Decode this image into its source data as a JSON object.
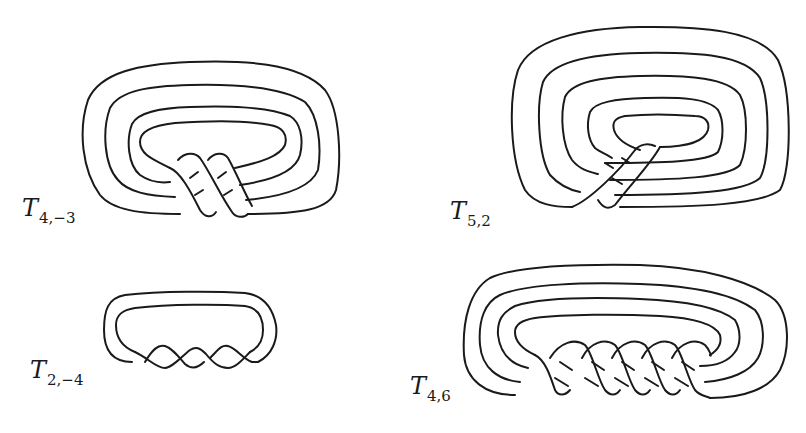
{
  "figure": {
    "stroke_color": "#1a1a1a",
    "background": "#ffffff",
    "panels": [
      {
        "id": "T4,-3",
        "label_main": "T",
        "label_sub": "4,−3",
        "strands": 4,
        "twists": 3,
        "position": "top-left"
      },
      {
        "id": "T5,2",
        "label_main": "T",
        "label_sub": "5,2",
        "strands": 5,
        "twists": 2,
        "position": "top-right"
      },
      {
        "id": "T2,-4",
        "label_main": "T",
        "label_sub": "2,−4",
        "strands": 2,
        "twists": 4,
        "position": "bottom-left"
      },
      {
        "id": "T4,6",
        "label_main": "T",
        "label_sub": "4,6",
        "strands": 4,
        "twists": 6,
        "position": "bottom-right"
      }
    ]
  }
}
